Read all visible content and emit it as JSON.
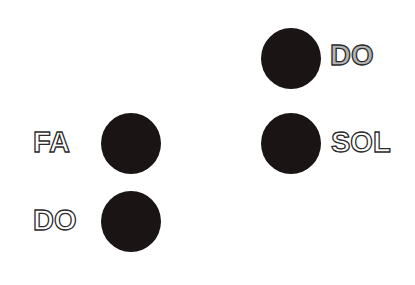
{
  "diagram": {
    "notes": [
      {
        "label": "DO",
        "style": "filled-gray"
      },
      {
        "label": "SOL",
        "style": "outline"
      },
      {
        "label": "FA",
        "style": "outline"
      },
      {
        "label": "DO",
        "style": "outline"
      }
    ]
  },
  "colors": {
    "dot": "#1a1414",
    "label_outline": "#2b2b2b",
    "label_gray_fill": "#b4b4b4",
    "background": "#ffffff"
  }
}
